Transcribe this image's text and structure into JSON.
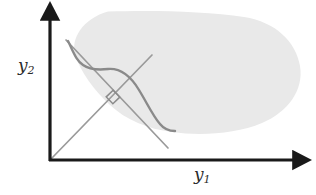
{
  "figure": {
    "kind": "diagram",
    "background_color": "#ffffff",
    "axes": {
      "x_label": "y",
      "x_label_sub": "1",
      "y_label": "y",
      "y_label_sub": "2",
      "color": "#1a1a1a",
      "origin": [
        50,
        160
      ],
      "x_axis_end": [
        302,
        160
      ],
      "y_axis_end": [
        50,
        11
      ],
      "line_width": 3.2,
      "arrowheads": true
    },
    "region": {
      "name": "attainable-set-blob",
      "fill_color": "#e9e9e9",
      "stroke": "none",
      "bounds": {
        "left": 74,
        "top": 11,
        "right": 301,
        "bottom": 134
      }
    },
    "curve": {
      "name": "efficient-frontier-curve",
      "stroke_color": "#8a8a8a",
      "stroke_width": 2.4,
      "shape": "s-shaped boundary arc"
    },
    "tangent_line": {
      "name": "supporting-tangent-line",
      "stroke_color": "#9a9a9a",
      "stroke_width": 1.7,
      "from": [
        66,
        40
      ],
      "to": [
        168,
        148
      ]
    },
    "ray": {
      "name": "ray-from-origin",
      "stroke_color": "#9a9a9a",
      "stroke_width": 1.7,
      "from": [
        51,
        159
      ],
      "to": [
        152,
        55
      ]
    },
    "right_angle_marker": {
      "name": "right-angle-marker",
      "stroke_color": "#8a8a8a",
      "stroke_width": 1.5,
      "center": [
        113,
        97
      ],
      "size": 9
    }
  }
}
